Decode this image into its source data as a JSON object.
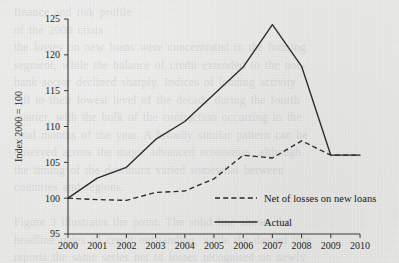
{
  "figure": {
    "background_color": "#e9e9e7",
    "ink_color": "#2a2a2a"
  },
  "bleed_through": {
    "text": "finance and risk profile\nof the 2008 crisis\nthe losses on new loans were concentrated in the housing\nsegment, while the balance of credit extended to the non-\nbank sector declined sharply. Indices of lending activity\nfell to their lowest level of the decade during the fourth\nquarter, with the bulk of the contraction occurring in the\nfinal months of the year. A broadly similar pattern can be\nobserved across the major advanced economies, although\nthe timing of the downturn varied somewhat between\ncountries and regions.\n\nFigure 3 illustrates the point. The solid line shows the\nheadline index of credit outstanding, while the dashed line\nreports the same series net of losses recognised on newly\noriginated loans. Until the middle of the decade the two\nmeasures diverge considerably, but they converge again\nafter 2009 as write-downs are absorbed."
  },
  "chart_data": {
    "type": "line",
    "title": "",
    "subtitle": "",
    "xlabel": "",
    "ylabel": "Index 2000 = 100",
    "x": [
      2000,
      2001,
      2002,
      2003,
      2004,
      2005,
      2006,
      2007,
      2008,
      2009,
      2010
    ],
    "xtick_labels": [
      "2000",
      "2001",
      "2002",
      "2003",
      "2004",
      "2005",
      "2006",
      "2007",
      "2008",
      "2009",
      "2010"
    ],
    "xlim": [
      2000,
      2010
    ],
    "ylim": [
      95,
      125
    ],
    "yticks": [
      95,
      100,
      105,
      110,
      115,
      120,
      125
    ],
    "ytick_labels": [
      "95",
      "100",
      "105",
      "110",
      "115",
      "120",
      "125"
    ],
    "grid": false,
    "legend_position": "inside-lower-right",
    "series": [
      {
        "name": "Net of losses on new loans",
        "style": "dashed",
        "values": [
          100,
          99.8,
          99.7,
          100.8,
          101.0,
          102.7,
          106.0,
          105.6,
          108.0,
          106.0,
          106.0
        ]
      },
      {
        "name": "Actual",
        "style": "solid",
        "values": [
          100,
          102.8,
          104.3,
          108.2,
          110.7,
          114.5,
          118.3,
          124.2,
          118.4,
          106.0,
          106.0
        ]
      }
    ],
    "legend": [
      {
        "label": "Net of losses on new loans",
        "style": "dashed"
      },
      {
        "label": "Actual",
        "style": "solid"
      }
    ]
  }
}
